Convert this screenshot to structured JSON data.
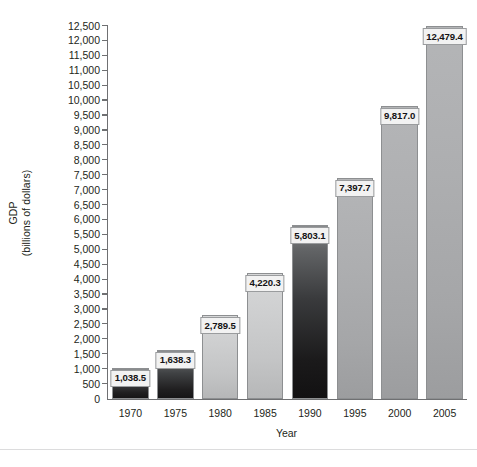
{
  "chart_data": {
    "type": "bar",
    "title": "",
    "xlabel": "Year",
    "ylabel_line1": "GDP",
    "ylabel_line2": "(billions of dollars)",
    "categories": [
      "1970",
      "1975",
      "1980",
      "1985",
      "1990",
      "1995",
      "2000",
      "2005"
    ],
    "values": [
      1038.5,
      1638.3,
      2789.5,
      4220.3,
      5803.1,
      7397.7,
      9817.0,
      12479.4
    ],
    "value_labels": [
      "1,038.5",
      "1,638.3",
      "2,789.5",
      "4,220.3",
      "5,803.1",
      "7,397.7",
      "9,817.0",
      "12,479.4"
    ],
    "ylim": [
      0,
      12500
    ],
    "ytick_step": 500,
    "ytick_labels": [
      "12,500",
      "12,000",
      "11,500",
      "11,000",
      "10,500",
      "10,000",
      "9,500",
      "9,000",
      "8,500",
      "8,000",
      "7,500",
      "7,000",
      "6,500",
      "6,000",
      "5,500",
      "5,000",
      "4,500",
      "4,000",
      "3,500",
      "3,000",
      "2,500",
      "2,000",
      "1,500",
      "1,000",
      "500",
      "0"
    ],
    "grid": false,
    "legend": null,
    "bar_shades": [
      "dark",
      "dark",
      "light",
      "light",
      "darkest",
      "medium",
      "medium",
      "medium"
    ],
    "colors": {
      "axis": "#6f7072",
      "text": "#231f20",
      "label_box_fill": "#f2f2f2",
      "bar_dark": "#2b2b2d",
      "bar_light": "#cacbcc",
      "bar_medium": "#a9aaac"
    }
  }
}
